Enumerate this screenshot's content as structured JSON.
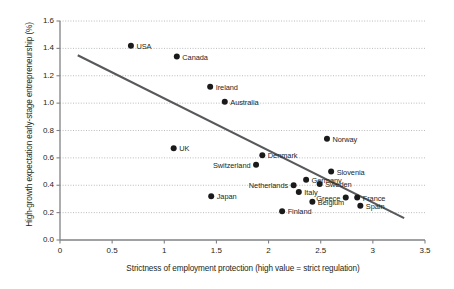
{
  "chart_data": {
    "type": "scatter",
    "title": "",
    "xlabel": "Strictness of employment protection (high value = strict regulation)",
    "ylabel": "High-growth expectation early-stage entrepreneurship (%)",
    "xlim": [
      0,
      3.5
    ],
    "ylim": [
      0.0,
      1.6
    ],
    "xticks": [
      "0",
      "0.5",
      "1",
      "1.5",
      "2",
      "2.5",
      "3",
      "3.5"
    ],
    "xtick_values": [
      0,
      0.5,
      1,
      1.5,
      2,
      2.5,
      3,
      3.5
    ],
    "yticks": [
      "0.0",
      "0.2",
      "0.4",
      "0.6",
      "0.8",
      "1.0",
      "1.2",
      "1.4",
      "1.6"
    ],
    "ytick_values": [
      0.0,
      0.2,
      0.4,
      0.6,
      0.8,
      1.0,
      1.2,
      1.4,
      1.6
    ],
    "grid": "horizontal-dotted",
    "legend": "none",
    "marker_color": "#1a1a1a",
    "trendline_color": "#58595b",
    "axis_color": "#808285",
    "points": [
      {
        "label": "USA",
        "x": 0.68,
        "y": 1.42,
        "label_side": "right"
      },
      {
        "label": "Canada",
        "x": 1.12,
        "y": 1.34,
        "label_side": "right"
      },
      {
        "label": "Ireland",
        "x": 1.44,
        "y": 1.12,
        "label_side": "right"
      },
      {
        "label": "Australia",
        "x": 1.58,
        "y": 1.01,
        "label_side": "right"
      },
      {
        "label": "UK",
        "x": 1.09,
        "y": 0.67,
        "label_side": "right"
      },
      {
        "label": "Norway",
        "x": 2.56,
        "y": 0.74,
        "label_side": "right"
      },
      {
        "label": "Denmark",
        "x": 1.94,
        "y": 0.62,
        "label_side": "right"
      },
      {
        "label": "Switzerland",
        "x": 1.88,
        "y": 0.55,
        "label_side": "left"
      },
      {
        "label": "Slovenia",
        "x": 2.6,
        "y": 0.5,
        "label_side": "right"
      },
      {
        "label": "Germany",
        "x": 2.36,
        "y": 0.44,
        "label_side": "right"
      },
      {
        "label": "Sweden",
        "x": 2.49,
        "y": 0.41,
        "label_side": "right"
      },
      {
        "label": "Netherlands",
        "x": 2.24,
        "y": 0.4,
        "label_side": "left"
      },
      {
        "label": "Italy",
        "x": 2.29,
        "y": 0.35,
        "label_side": "right"
      },
      {
        "label": "Japan",
        "x": 1.45,
        "y": 0.32,
        "label_side": "right"
      },
      {
        "label": "Greece",
        "x": 2.74,
        "y": 0.31,
        "label_side": "left"
      },
      {
        "label": "Belgium",
        "x": 2.42,
        "y": 0.28,
        "label_side": "right"
      },
      {
        "label": "France",
        "x": 2.85,
        "y": 0.31,
        "label_side": "right"
      },
      {
        "label": "Spain",
        "x": 2.88,
        "y": 0.25,
        "label_side": "right"
      },
      {
        "label": "Finland",
        "x": 2.13,
        "y": 0.21,
        "label_side": "right"
      }
    ],
    "trendline": {
      "x0": 0.17,
      "y0": 1.35,
      "x1": 3.3,
      "y1": 0.16
    }
  }
}
